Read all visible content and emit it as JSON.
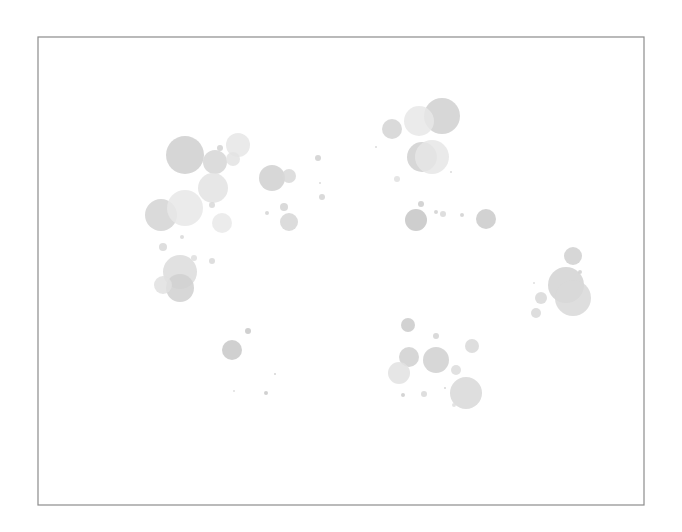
{
  "chart_data": {
    "type": "scatter",
    "subtype": "bubble",
    "title": "",
    "xlabel": "",
    "ylabel": "",
    "grid": false,
    "legend": null,
    "axes_visible": false,
    "frame": {
      "x": 38,
      "y": 37,
      "width": 606,
      "height": 468,
      "stroke": "#8c8c8c"
    },
    "points": [
      {
        "x": 185,
        "y": 155,
        "r": 19,
        "color": "#cfcfcf"
      },
      {
        "x": 215,
        "y": 162,
        "r": 12,
        "color": "#d6d6d6"
      },
      {
        "x": 238,
        "y": 145,
        "r": 12,
        "color": "#e6e6e6"
      },
      {
        "x": 233,
        "y": 159,
        "r": 7,
        "color": "#e3e3e3"
      },
      {
        "x": 220,
        "y": 148,
        "r": 3,
        "color": "#d2d2d2"
      },
      {
        "x": 213,
        "y": 188,
        "r": 15,
        "color": "#e3e3e3"
      },
      {
        "x": 161,
        "y": 215,
        "r": 16,
        "color": "#d4d4d4"
      },
      {
        "x": 185,
        "y": 208,
        "r": 18,
        "color": "#e8e8e8"
      },
      {
        "x": 222,
        "y": 223,
        "r": 10,
        "color": "#e9e9e9"
      },
      {
        "x": 212,
        "y": 205,
        "r": 3,
        "color": "#d8d8d8"
      },
      {
        "x": 180,
        "y": 272,
        "r": 17,
        "color": "#dcdcdc"
      },
      {
        "x": 180,
        "y": 288,
        "r": 14,
        "color": "#d0d0d0"
      },
      {
        "x": 163,
        "y": 285,
        "r": 9,
        "color": "#e0e0e0"
      },
      {
        "x": 163,
        "y": 247,
        "r": 4,
        "color": "#d8d8d8"
      },
      {
        "x": 182,
        "y": 237,
        "r": 2,
        "color": "#d8d8d8"
      },
      {
        "x": 212,
        "y": 261,
        "r": 3,
        "color": "#d8d8d8"
      },
      {
        "x": 194,
        "y": 258,
        "r": 3,
        "color": "#dedede"
      },
      {
        "x": 272,
        "y": 178,
        "r": 13,
        "color": "#d0d0d0"
      },
      {
        "x": 289,
        "y": 176,
        "r": 7,
        "color": "#d8d8d8"
      },
      {
        "x": 318,
        "y": 158,
        "r": 3,
        "color": "#d0d0d0"
      },
      {
        "x": 322,
        "y": 197,
        "r": 3,
        "color": "#d4d4d4"
      },
      {
        "x": 320,
        "y": 183,
        "r": 1,
        "color": "#d4d4d4"
      },
      {
        "x": 284,
        "y": 207,
        "r": 4,
        "color": "#d4d4d4"
      },
      {
        "x": 289,
        "y": 222,
        "r": 9,
        "color": "#d6d6d6"
      },
      {
        "x": 267,
        "y": 213,
        "r": 2,
        "color": "#d4d4d4"
      },
      {
        "x": 442,
        "y": 116,
        "r": 18,
        "color": "#d0d0d0"
      },
      {
        "x": 419,
        "y": 121,
        "r": 15,
        "color": "#e8e8e8"
      },
      {
        "x": 392,
        "y": 129,
        "r": 10,
        "color": "#d4d4d4"
      },
      {
        "x": 422,
        "y": 157,
        "r": 15,
        "color": "#d0d0d0"
      },
      {
        "x": 432,
        "y": 157,
        "r": 17,
        "color": "#e6e6e6"
      },
      {
        "x": 397,
        "y": 179,
        "r": 3,
        "color": "#e0e0e0"
      },
      {
        "x": 451,
        "y": 172,
        "r": 1,
        "color": "#d4d4d4"
      },
      {
        "x": 376,
        "y": 147,
        "r": 1,
        "color": "#d4d4d4"
      },
      {
        "x": 416,
        "y": 220,
        "r": 11,
        "color": "#c6c6c6"
      },
      {
        "x": 421,
        "y": 204,
        "r": 3,
        "color": "#cccccc"
      },
      {
        "x": 436,
        "y": 212,
        "r": 2,
        "color": "#d0d0d0"
      },
      {
        "x": 443,
        "y": 214,
        "r": 3,
        "color": "#d8d8d8"
      },
      {
        "x": 462,
        "y": 215,
        "r": 2,
        "color": "#d0d0d0"
      },
      {
        "x": 486,
        "y": 219,
        "r": 10,
        "color": "#cacaca"
      },
      {
        "x": 573,
        "y": 256,
        "r": 9,
        "color": "#d0d0d0"
      },
      {
        "x": 566,
        "y": 285,
        "r": 18,
        "color": "#d2d2d2"
      },
      {
        "x": 573,
        "y": 298,
        "r": 18,
        "color": "#d8d8d8"
      },
      {
        "x": 580,
        "y": 272,
        "r": 2,
        "color": "#d0d0d0"
      },
      {
        "x": 541,
        "y": 298,
        "r": 6,
        "color": "#d8d8d8"
      },
      {
        "x": 536,
        "y": 313,
        "r": 5,
        "color": "#d8d8d8"
      },
      {
        "x": 534,
        "y": 283,
        "r": 1,
        "color": "#d8d8d8"
      },
      {
        "x": 408,
        "y": 325,
        "r": 7,
        "color": "#cacaca"
      },
      {
        "x": 436,
        "y": 336,
        "r": 3,
        "color": "#d4d4d4"
      },
      {
        "x": 472,
        "y": 346,
        "r": 7,
        "color": "#d8d8d8"
      },
      {
        "x": 409,
        "y": 357,
        "r": 10,
        "color": "#d0d0d0"
      },
      {
        "x": 436,
        "y": 360,
        "r": 13,
        "color": "#d0d0d0"
      },
      {
        "x": 399,
        "y": 373,
        "r": 11,
        "color": "#e2e2e2"
      },
      {
        "x": 456,
        "y": 370,
        "r": 5,
        "color": "#dcdcdc"
      },
      {
        "x": 466,
        "y": 393,
        "r": 16,
        "color": "#d8d8d8"
      },
      {
        "x": 403,
        "y": 395,
        "r": 2,
        "color": "#cccccc"
      },
      {
        "x": 424,
        "y": 394,
        "r": 3,
        "color": "#d8d8d8"
      },
      {
        "x": 445,
        "y": 388,
        "r": 1,
        "color": "#d0d0d0"
      },
      {
        "x": 454,
        "y": 405,
        "r": 2,
        "color": "#dedede"
      },
      {
        "x": 232,
        "y": 350,
        "r": 10,
        "color": "#c8c8c8"
      },
      {
        "x": 248,
        "y": 331,
        "r": 3,
        "color": "#c8c8c8"
      },
      {
        "x": 275,
        "y": 374,
        "r": 1,
        "color": "#cccccc"
      },
      {
        "x": 266,
        "y": 393,
        "r": 2,
        "color": "#c8c8c8"
      },
      {
        "x": 234,
        "y": 391,
        "r": 1,
        "color": "#d8d8d8"
      }
    ]
  }
}
